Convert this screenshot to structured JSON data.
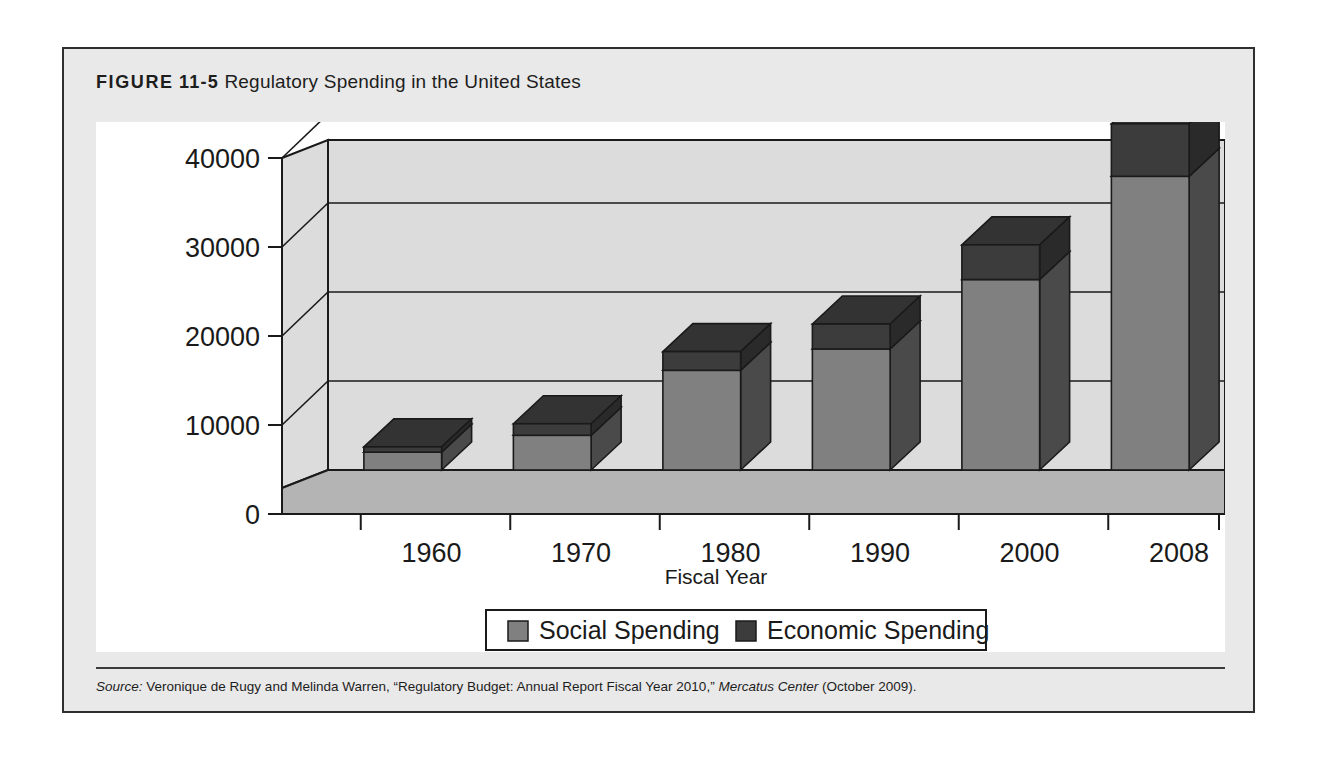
{
  "figure": {
    "label_word": "FIGURE",
    "label_number": "11-5",
    "title": "Regulatory Spending in the United States"
  },
  "source": {
    "label": "Source:",
    "text": " Veronique de Rugy and Melinda Warren, “Regulatory Budget: Annual Report Fiscal Year 2010,” ",
    "publication": "Mercatus Center",
    "date": " (October 2009)."
  },
  "colors": {
    "panel_background": "#e9e9e9",
    "plot_background": "#ffffff",
    "wall": "#dcdcdc",
    "floor": "#b4b4b4",
    "social_face": "#808080",
    "social_side": "#4a4a4a",
    "social_top": "#6d6d6d",
    "economic_face": "#3c3c3c",
    "economic_side": "#2a2a2a",
    "economic_top": "#333333",
    "line": "#1a1a1a"
  },
  "chart_data": {
    "type": "bar",
    "subtype": "stacked-3d-column",
    "title": "Regulatory Spending in the United States",
    "xlabel": "Fiscal Year",
    "ylabel": "",
    "categories": [
      "1960",
      "1970",
      "1980",
      "1990",
      "2000",
      "2008"
    ],
    "yticks": [
      "0",
      "10000",
      "20000",
      "30000",
      "40000"
    ],
    "ylim": [
      0,
      40000
    ],
    "grid": true,
    "legend_position": "bottom",
    "series": [
      {
        "name": "Social Spending",
        "color": "#808080",
        "values": [
          2000,
          3900,
          11200,
          13600,
          21400,
          33000
        ]
      },
      {
        "name": "Economic Spending",
        "color": "#3c3c3c",
        "values": [
          600,
          1300,
          2100,
          2800,
          3900,
          5900
        ]
      }
    ],
    "totals": [
      2600,
      5200,
      13300,
      16400,
      25300,
      38900
    ]
  }
}
